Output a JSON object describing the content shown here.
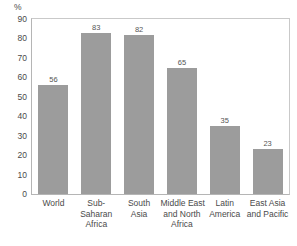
{
  "chart_data": {
    "type": "bar",
    "title": "",
    "subtitle": "",
    "xlabel": "",
    "ylabel": "%",
    "ylim": [
      0,
      90
    ],
    "yticks": [
      0,
      10,
      20,
      30,
      40,
      50,
      60,
      70,
      80,
      90
    ],
    "grid": false,
    "legend": null,
    "bar_color": "#9c9c9c",
    "axis_color": "#b5b5b5",
    "text_color": "#4a4a4a",
    "categories": [
      "World",
      "Sub-Saharan Africa",
      "South Asia",
      "Middle East and North Africa",
      "Latin America",
      "East Asia and Pacific"
    ],
    "category_lines": [
      [
        "World"
      ],
      [
        "Sub-",
        "Saharan",
        "Africa"
      ],
      [
        "South",
        "Asia"
      ],
      [
        "Middle East",
        "and North",
        "Africa"
      ],
      [
        "Latin",
        "America"
      ],
      [
        "East Asia",
        "and Pacific"
      ]
    ],
    "values": [
      56,
      83,
      82,
      65,
      35,
      23
    ],
    "value_labels": [
      "56",
      "83",
      "82",
      "65",
      "35",
      "23"
    ]
  }
}
